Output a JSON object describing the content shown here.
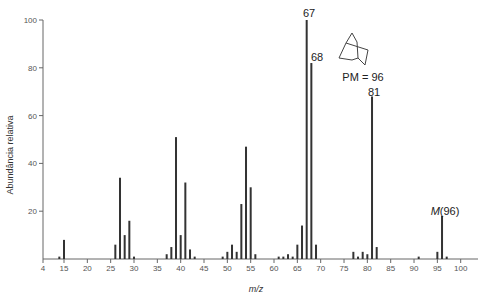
{
  "chart_data": {
    "type": "bar",
    "title": "",
    "xlabel": "m/z",
    "ylabel": "Abundância relativa",
    "xlim": [
      4,
      103
    ],
    "ylim": [
      0,
      100
    ],
    "grid": false,
    "x_ticks": [
      4,
      15,
      20,
      25,
      30,
      35,
      40,
      45,
      50,
      55,
      60,
      65,
      70,
      75,
      80,
      85,
      90,
      95,
      100
    ],
    "y_ticks": [
      20,
      40,
      60,
      80,
      100
    ],
    "x": [
      14,
      15,
      26,
      27,
      28,
      29,
      30,
      37,
      38,
      39,
      40,
      41,
      42,
      43,
      49,
      50,
      51,
      52,
      53,
      54,
      55,
      56,
      61,
      62,
      63,
      64,
      65,
      66,
      67,
      68,
      69,
      77,
      78,
      79,
      80,
      81,
      82,
      91,
      95,
      96,
      97
    ],
    "values": [
      1,
      8,
      6,
      34,
      10,
      16,
      1,
      2,
      5,
      51,
      10,
      32,
      4,
      1,
      1,
      3,
      6,
      3,
      23,
      47,
      30,
      2,
      1,
      1,
      2,
      1,
      6,
      14,
      100,
      82,
      6,
      3,
      1,
      3,
      2,
      68,
      5,
      1,
      3,
      18,
      1
    ],
    "annotations": [
      {
        "text": "67",
        "x": 67,
        "y": 100
      },
      {
        "text": "68",
        "x": 68,
        "y": 82
      },
      {
        "text": "81",
        "x": 81,
        "y": 68
      },
      {
        "text_italic": "M",
        "text": "(96)",
        "x": 96,
        "y": 18
      }
    ],
    "inset": {
      "structure": "norbornane (bicyclo[2.2.1]heptane)",
      "label": "PM = 96"
    }
  },
  "axes": {
    "xlabel": "m/z",
    "ylabel": "Abundância relativa"
  },
  "labels": {
    "peak67": "67",
    "peak68": "68",
    "peak81": "81",
    "molecular_ion_M": "M",
    "molecular_ion_value": "(96)",
    "pm": "PM = 96"
  },
  "colors": {
    "bar": "#333333",
    "axis": "#666666"
  }
}
